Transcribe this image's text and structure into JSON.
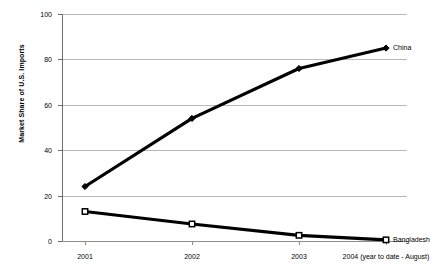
{
  "chart_data": {
    "type": "line",
    "title": "",
    "xlabel": "",
    "ylabel": "Market Share of U.S. Imports",
    "categories": [
      "2001",
      "2002",
      "2003",
      "2004 (year to date - August)"
    ],
    "ylim": [
      0,
      100
    ],
    "yticks": [
      0,
      20,
      40,
      60,
      80,
      100
    ],
    "ytick_labels": [
      "0",
      "20",
      "40",
      "60",
      "80",
      "100"
    ],
    "grid": true,
    "legend_position": "inline-end-of-line",
    "series": [
      {
        "name": "China",
        "values": [
          24,
          54,
          76,
          85
        ],
        "color": "#000000",
        "marker": "diamond",
        "label": "China"
      },
      {
        "name": "Bangladesh",
        "values": [
          13,
          7.5,
          2.5,
          0.5
        ],
        "color": "#000000",
        "marker": "open-square",
        "label": "Bangladesh"
      }
    ]
  },
  "axis": {
    "y_title": "Market Share of U.S. Imports",
    "y_labels": [
      "100",
      "80",
      "60",
      "40",
      "20",
      "0"
    ],
    "x_labels": [
      "2001",
      "2002",
      "2003",
      "2004 (year to date - August)"
    ]
  },
  "labels": {
    "china": "China",
    "bangladesh": "Bangladesh"
  },
  "colors": {
    "line": "#000000",
    "gridline": "#b9b9b9",
    "axis": "#6e6e6e",
    "background": "#ffffff"
  }
}
